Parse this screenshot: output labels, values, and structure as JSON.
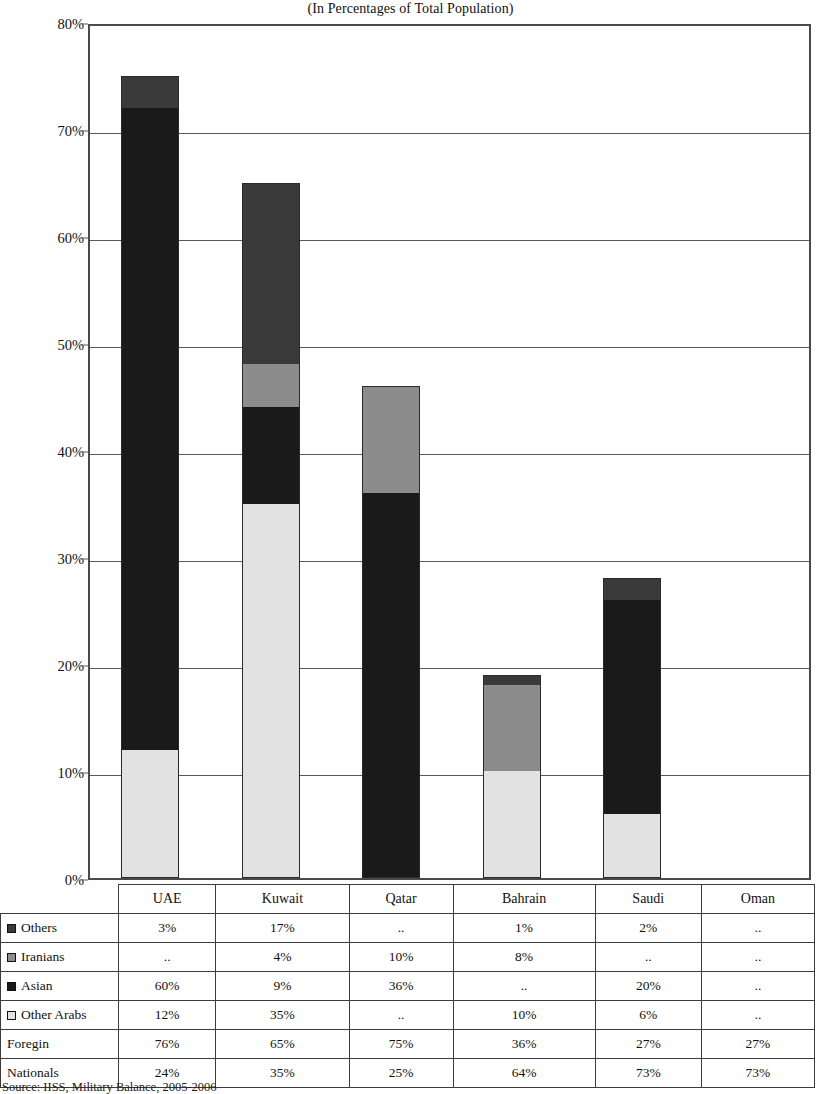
{
  "chart_title": "(In Percentages of Total Population)",
  "source": "Source: IISS, Military Balance, 2005-2006",
  "axis": {
    "ylabel": "",
    "xlabel": "",
    "yticks": [
      "0%",
      "10%",
      "20%",
      "30%",
      "40%",
      "50%",
      "60%",
      "70%",
      "80%"
    ]
  },
  "colors": {
    "others": "#3a3a3a",
    "iranians": "#8c8c8c",
    "asian": "#1a1a1a",
    "other_arabs": "#e2e2e2",
    "axis": "#4a4a4a",
    "grid": "#59595c",
    "border": "#2b2b2b"
  },
  "table": {
    "corner_label": "",
    "columns": [
      "UAE",
      "Kuwait",
      "Qatar",
      "Bahrain",
      "Saudi",
      "Oman"
    ],
    "rows": [
      {
        "label": "Others",
        "swatch": "others",
        "has_swatch": true,
        "values": [
          "3%",
          "17%",
          "..",
          "1%",
          "2%",
          ".."
        ]
      },
      {
        "label": "Iranians",
        "swatch": "iranians",
        "has_swatch": true,
        "values": [
          "..",
          "4%",
          "10%",
          "8%",
          "..",
          ".."
        ]
      },
      {
        "label": "Asian",
        "swatch": "asian",
        "has_swatch": true,
        "values": [
          "60%",
          "9%",
          "36%",
          "..",
          "20%",
          ".."
        ]
      },
      {
        "label": "Other Arabs",
        "swatch": "other_arabs",
        "has_swatch": true,
        "values": [
          "12%",
          "35%",
          "..",
          "10%",
          "6%",
          ".."
        ]
      },
      {
        "label": "Foregin",
        "swatch": "",
        "has_swatch": false,
        "values": [
          "76%",
          "65%",
          "75%",
          "36%",
          "27%",
          "27%"
        ]
      },
      {
        "label": "Nationals",
        "swatch": "",
        "has_swatch": false,
        "values": [
          "24%",
          "35%",
          "25%",
          "64%",
          "73%",
          "73%"
        ]
      }
    ]
  },
  "chart_data": {
    "type": "bar",
    "stacked": true,
    "title": "(In Percentages of Total Population)",
    "xlabel": "",
    "ylabel": "",
    "ylim": [
      0,
      80
    ],
    "yticks": [
      0,
      10,
      20,
      30,
      40,
      50,
      60,
      70,
      80
    ],
    "grid": true,
    "legend": [
      "Others",
      "Iranians",
      "Asian",
      "Other Arabs"
    ],
    "legend_position": "table-row-headers",
    "categories": [
      "UAE",
      "Kuwait",
      "Qatar",
      "Bahrain",
      "Saudi",
      "Oman"
    ],
    "series": [
      {
        "name": "Other Arabs",
        "color": "#e2e2e2",
        "values": [
          12,
          35,
          0,
          10,
          6,
          0
        ]
      },
      {
        "name": "Asian",
        "color": "#1a1a1a",
        "values": [
          60,
          9,
          36,
          0,
          20,
          0
        ]
      },
      {
        "name": "Iranians",
        "color": "#8c8c8c",
        "values": [
          0,
          4,
          10,
          8,
          0,
          0
        ]
      },
      {
        "name": "Others",
        "color": "#3a3a3a",
        "values": [
          3,
          17,
          0,
          1,
          2,
          0
        ]
      }
    ],
    "totals": [
      75,
      65,
      46,
      19,
      28,
      0
    ]
  }
}
